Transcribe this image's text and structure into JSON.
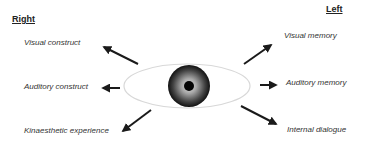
{
  "headers": {
    "right": "Right",
    "left": "Left"
  },
  "labels": {
    "visual_construct": "Visual construct",
    "auditory_construct": "Auditory construct",
    "kinaesthetic_experience": "Kinaesthetic experience",
    "visual_memory": "Visual memory",
    "auditory_memory": "Auditory memory",
    "internal_dialogue": "Internal dialogue"
  },
  "eye": {
    "icon": "eye-icon",
    "sclera_outline_color": "#d8d8d8",
    "iris_outer_color": "#1a1a1a",
    "iris_inner_color": "#bdbdbd",
    "pupil_color": "#050505"
  },
  "arrows": [
    {
      "name": "arrow-up-left",
      "target": "visual_construct"
    },
    {
      "name": "arrow-left",
      "target": "auditory_construct"
    },
    {
      "name": "arrow-down-left",
      "target": "kinaesthetic_experience"
    },
    {
      "name": "arrow-up-right",
      "target": "visual_memory"
    },
    {
      "name": "arrow-right",
      "target": "auditory_memory"
    },
    {
      "name": "arrow-down-right",
      "target": "internal_dialogue"
    }
  ]
}
